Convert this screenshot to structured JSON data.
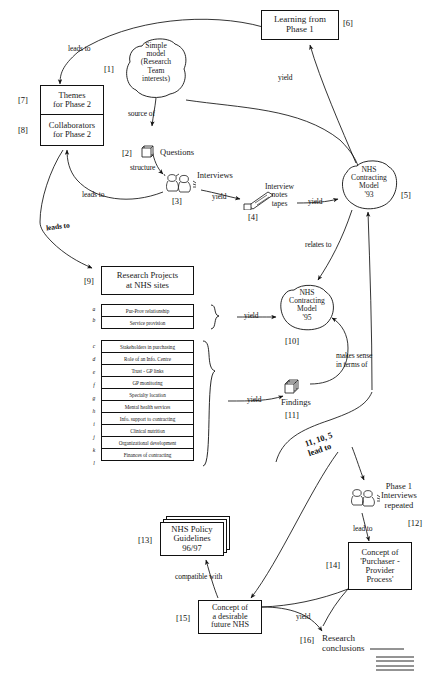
{
  "diagram": {
    "nodes": {
      "n1": {
        "tag": "[1]",
        "label": "Simple\nmodel\n(Research\nTeam\ninterests)",
        "shape": "cloud"
      },
      "n2": {
        "tag": "[2]",
        "label": "Questions",
        "shape": "doc-icon"
      },
      "n3": {
        "tag": "[3]",
        "label": "Interviews",
        "shape": "people-icon"
      },
      "n4": {
        "tag": "[4]",
        "label": "Interview\nnotes\ntapes",
        "shape": "tape-icon"
      },
      "n5": {
        "tag": "[5]",
        "label": "NHS\nContracting\nModel\n'93",
        "shape": "cloud"
      },
      "n6": {
        "tag": "[6]",
        "label": "Learning from\nPhase 1",
        "shape": "box"
      },
      "n7": {
        "tag": "[7]",
        "label": "Themes\nfor Phase 2",
        "shape": "box"
      },
      "n8": {
        "tag": "[8]",
        "label": "Collaborators\nfor Phase 2",
        "shape": "box"
      },
      "n9": {
        "tag": "[9]",
        "label": "Research Projects\nat NHS sites",
        "shape": "box"
      },
      "n10": {
        "tag": "[10]",
        "label": "NHS\nContracting\nModel\n'95",
        "shape": "cloud"
      },
      "n11": {
        "tag": "[11]",
        "label": "Findings",
        "shape": "doc-icon"
      },
      "n12": {
        "tag": "[12]",
        "label": "Phase 1\nInterviews\nrepeated",
        "shape": "people-icon"
      },
      "n13": {
        "tag": "[13]",
        "label": "NHS Policy\nGuidelines\n96/97",
        "shape": "stacked-box"
      },
      "n14": {
        "tag": "[14]",
        "label": "Concept of\n'Purchaser -\nProvider\nProcess'",
        "shape": "box"
      },
      "n15": {
        "tag": "[15]",
        "label": "Concept of\na desirable\nfuture NHS",
        "shape": "box"
      },
      "n16": {
        "tag": "[16]",
        "label": "Research\nconclusions",
        "shape": "text"
      }
    },
    "project_rows_group1": [
      {
        "letter": "a",
        "label": "Pur-Prov relationship"
      },
      {
        "letter": "b",
        "label": "Service provision"
      }
    ],
    "project_rows_group2": [
      {
        "letter": "c",
        "label": "Stakeholders in purchasing"
      },
      {
        "letter": "d",
        "label": "Role of an Info. Centre"
      },
      {
        "letter": "e",
        "label": "Trust - GP links"
      },
      {
        "letter": "f",
        "label": "GP monitoring"
      },
      {
        "letter": "g",
        "label": "Specialty location"
      },
      {
        "letter": "h",
        "label": "Mental health services"
      },
      {
        "letter": "i",
        "label": "Info. support to contracting"
      },
      {
        "letter": "j",
        "label": "Clinical nutrition"
      },
      {
        "letter": "k",
        "label": "Organizational development"
      },
      {
        "letter": "l",
        "label": "Finances of contracting"
      }
    ],
    "relations": {
      "r_leads_to_themes": "leads to",
      "r_source_of": "source of",
      "r_structure": "structure",
      "r_yield_interviews": "yield",
      "r_yield_tapes": "yield",
      "r_yield_phase1": "yield",
      "r_leads_to_collab": "leads to",
      "r_leads_to_projects": "leads to",
      "r_relates_to": "relates to",
      "r_yield_model95": "yield",
      "r_yield_findings": "yield",
      "r_makes_sense": "makes sense\nin terms of",
      "r_11_10_5": "11, 10, 5\nlead to",
      "r_lead_to_concept": "lead to",
      "r_compatible_with": "compatible with",
      "r_yield_conclusions": "yield"
    },
    "colors": {
      "ink": "#111111",
      "paper": "#ffffff"
    }
  }
}
